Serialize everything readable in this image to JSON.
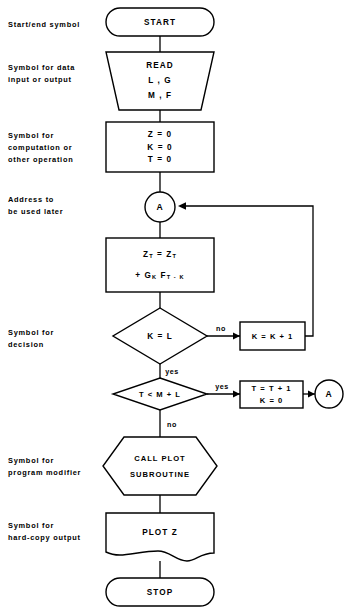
{
  "diagram": {
    "colors": {
      "stroke": "#000000",
      "fill": "#ffffff",
      "background": "#ffffff"
    }
  },
  "side_labels": [
    {
      "id": "terminal",
      "line1": "Start/end symbol",
      "line2": ""
    },
    {
      "id": "io",
      "line1": "Symbol for data",
      "line2": "input or output"
    },
    {
      "id": "process",
      "line1": "Symbol for",
      "line2": "computation or",
      "line3": "other operation"
    },
    {
      "id": "connector",
      "line1": "Address to",
      "line2": "be used later"
    },
    {
      "id": "decision",
      "line1": "Symbol for",
      "line2": "decision"
    },
    {
      "id": "predefined",
      "line1": "Symbol for",
      "line2": "program modifier"
    },
    {
      "id": "document",
      "line1": "Symbol for",
      "line2": "hard-copy output"
    }
  ],
  "nodes": {
    "start": {
      "shape": "terminal",
      "label": "START"
    },
    "read": {
      "shape": "input-output",
      "line1": "READ",
      "line2": "L , G",
      "line3": "M , F"
    },
    "init": {
      "shape": "process",
      "line1": "Z = 0",
      "line2": "K = 0",
      "line3": "T = 0"
    },
    "connector_a_left": {
      "shape": "connector",
      "label": "A"
    },
    "accumulate": {
      "shape": "process",
      "line1_a": "Z",
      "line1_sub_a": "T",
      "line1_op": " = ",
      "line1_b": "Z",
      "line1_sub_b": "T",
      "line2_plus": "+ ",
      "line2_g": "G",
      "line2_g_sub": "K",
      "line2_f": " F",
      "line2_f_sub": "T - K"
    },
    "decision_k": {
      "shape": "decision",
      "label": "K = L",
      "yes": "yes",
      "no": "no"
    },
    "increment_k": {
      "shape": "process",
      "label": "K = K + 1"
    },
    "decision_t": {
      "shape": "decision",
      "label": "T < M + L",
      "yes": "yes",
      "no": "no"
    },
    "advance_t": {
      "shape": "process",
      "line1": "T = T + 1",
      "line2": "K = 0"
    },
    "connector_a_right": {
      "shape": "connector",
      "label": "A"
    },
    "call_plot": {
      "shape": "predefined-process",
      "line1": "CALL PLOT",
      "line2": "SUBROUTINE"
    },
    "plot_z": {
      "shape": "document",
      "label": "PLOT Z"
    },
    "stop": {
      "shape": "terminal",
      "label": "STOP"
    }
  },
  "edge_labels": {
    "k_no": "no",
    "k_yes": "yes",
    "t_yes": "yes",
    "t_no": "no"
  }
}
